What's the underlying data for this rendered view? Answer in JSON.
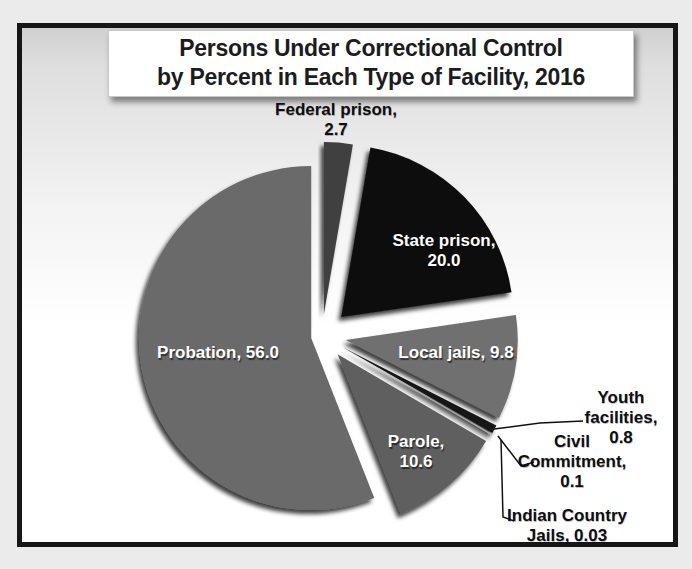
{
  "title": {
    "line1": "Persons Under Correctional Control",
    "line2": "by Percent in Each Type of Facility, 2016"
  },
  "chart_data": {
    "type": "pie",
    "title": "Persons Under Correctional Control by Percent in Each Type of Facility, 2016",
    "unit": "percent",
    "legend_position": "none",
    "style": "exploded pie with drop shadows, grayscale",
    "slices": [
      {
        "name": "Federal prison",
        "value": 2.7,
        "color": "#3f3f3f",
        "explode": 22,
        "label_lines": [
          "Federal prison,",
          "2.7"
        ]
      },
      {
        "name": "State prison",
        "value": 20.0,
        "color": "#0d0d0d",
        "explode": 27,
        "label_lines": [
          "State prison,",
          "20.0"
        ]
      },
      {
        "name": "Local jails",
        "value": 9.8,
        "color": "#6f6f6f",
        "explode": 24,
        "label_lines": [
          "Local jails, 9.8"
        ]
      },
      {
        "name": "Youth facilities",
        "value": 0.8,
        "color": "#181818",
        "explode": 24,
        "label_lines": [
          "Youth",
          "facilities,",
          "0.8"
        ]
      },
      {
        "name": "Civil Commitment",
        "value": 0.1,
        "color": "#9a9a9a",
        "explode": 24,
        "label_lines": [
          "Civil",
          "Commitment,",
          "0.1"
        ]
      },
      {
        "name": "Indian Country Jails",
        "value": 0.03,
        "color": "#ededed",
        "explode": 24,
        "label_lines": [
          "Indian Country",
          "Jails, 0.03"
        ]
      },
      {
        "name": "Parole",
        "value": 10.6,
        "color": "#5e5e5e",
        "explode": 24,
        "label_lines": [
          "Parole,",
          "10.6"
        ]
      },
      {
        "name": "Probation",
        "value": 56.0,
        "color": "#6a6a6a",
        "explode": 11,
        "label_lines": [
          "Probation, 56.0"
        ]
      }
    ]
  }
}
